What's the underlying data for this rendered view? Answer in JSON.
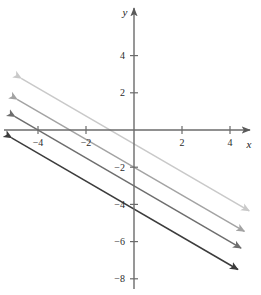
{
  "chart_data": {
    "type": "line",
    "title": "",
    "xlabel": "x",
    "ylabel": "y",
    "xlim": [
      -5.6,
      5.0
    ],
    "ylim": [
      -8.9,
      5.6
    ],
    "grid": false,
    "legend": "none",
    "x_ticks": [
      -4,
      -2,
      2,
      4
    ],
    "x_tick_labels": [
      "−4",
      "−2",
      "2",
      "4"
    ],
    "y_ticks": [
      4,
      2,
      -2,
      -4,
      -6,
      -8
    ],
    "y_tick_labels": [
      "4",
      "2",
      "−2",
      "−4",
      "−6",
      "−8"
    ],
    "series": [
      {
        "name": "line-1",
        "slope": -0.75,
        "intercept": -0.75,
        "color": "#c9c9c9",
        "x_intercept": -1.0,
        "endpoints": [
          [
            -4.7,
            2.78
          ],
          [
            4.8,
            -4.35
          ]
        ],
        "arrowheads": "both"
      },
      {
        "name": "line-2",
        "slope": -0.75,
        "intercept": -2.0,
        "color": "#a3a3a3",
        "x_intercept": -2.67,
        "endpoints": [
          [
            -4.87,
            1.65
          ],
          [
            4.6,
            -5.45
          ]
        ],
        "arrowheads": "both"
      },
      {
        "name": "line-3",
        "slope": -0.75,
        "intercept": -3.0,
        "color": "#6e6e6e",
        "x_intercept": -4.0,
        "endpoints": [
          [
            -4.96,
            0.72
          ],
          [
            4.46,
            -6.35
          ]
        ],
        "arrowheads": "both"
      },
      {
        "name": "line-4",
        "slope": -0.75,
        "intercept": -4.25,
        "color": "#3c3c3c",
        "x_intercept": -5.67,
        "endpoints": [
          [
            -5.1,
            -0.42
          ],
          [
            4.33,
            -7.5
          ]
        ],
        "arrowheads": "both"
      }
    ]
  },
  "axes": {
    "x_axis_label": "x",
    "y_axis_label": "y",
    "axis_color": "#5a5a5a"
  }
}
